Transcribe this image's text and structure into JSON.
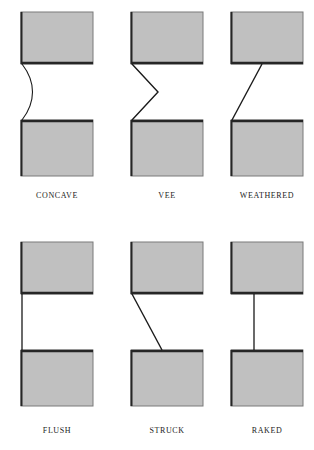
{
  "figure": {
    "background_color": "#ffffff",
    "brick_fill_color": "#c0c0c0",
    "brick_outline_color": "#7a7a7a",
    "shadow_edge_color": "#262626",
    "joint_line_color": "#1a1a1a",
    "rows": 2,
    "columns": 3
  },
  "joints": [
    {
      "id": "concave",
      "label": "CONCAVE",
      "profile_type": "curved",
      "description": "Curved joint line bowing outward to the right between the two bricks",
      "row": 0,
      "column": 0,
      "x": 5,
      "y": 8,
      "label_y": 183
    },
    {
      "id": "vee",
      "label": "VEE",
      "profile_type": "vee",
      "description": "V-shaped joint with apex pointing right at mid-height",
      "row": 0,
      "column": 1,
      "x": 115,
      "y": 8,
      "label_y": 183
    },
    {
      "id": "weathered",
      "label": "WEATHERED",
      "profile_type": "diagonal-down-left",
      "description": "Straight diagonal sloping from upper right down to lower left",
      "row": 0,
      "column": 2,
      "x": 215,
      "y": 8,
      "label_y": 183
    },
    {
      "id": "flush",
      "label": "FLUSH",
      "profile_type": "vertical-flush",
      "description": "Straight vertical joint line flush with the brick face",
      "row": 1,
      "column": 0,
      "x": 5,
      "y": 238,
      "label_y": 188
    },
    {
      "id": "struck",
      "label": "STRUCK",
      "profile_type": "diagonal-down-right",
      "description": "Straight diagonal sloping from upper left down to lower right",
      "row": 1,
      "column": 1,
      "x": 115,
      "y": 238,
      "label_y": 188
    },
    {
      "id": "raked",
      "label": "RAKED",
      "profile_type": "vertical-recessed",
      "description": "Vertical joint line recessed back from the brick face",
      "row": 1,
      "column": 2,
      "x": 215,
      "y": 238,
      "label_y": 188
    }
  ]
}
